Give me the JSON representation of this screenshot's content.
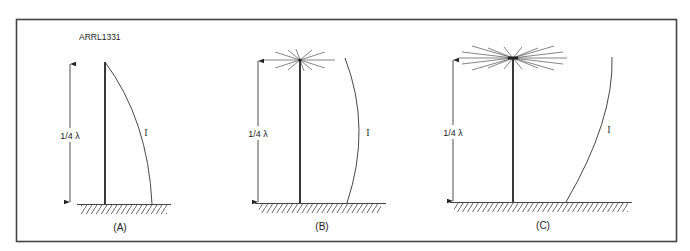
{
  "figure": {
    "id_label": "ARRL1331",
    "panels": [
      {
        "key": "A",
        "caption": "(A)",
        "height_label": "1/4 λ",
        "current_label": "I",
        "top_load": "none"
      },
      {
        "key": "B",
        "caption": "(B)",
        "height_label": "1/4 λ",
        "current_label": "I",
        "top_load": "small radial hat"
      },
      {
        "key": "C",
        "caption": "(C)",
        "height_label": "1/4 λ",
        "current_label": "I",
        "top_load": "large radial hat"
      }
    ]
  },
  "colors": {
    "line": "#2a2a2a",
    "thin_line": "#555555",
    "border": "#444444",
    "background": "#ffffff"
  }
}
